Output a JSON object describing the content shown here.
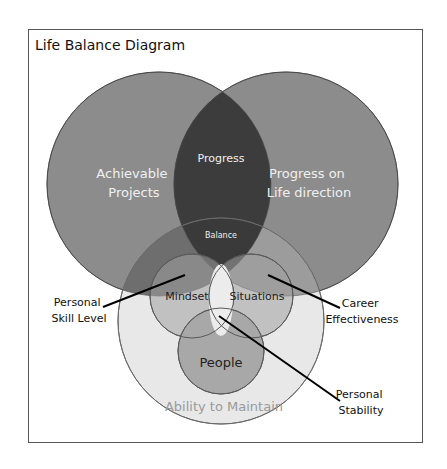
{
  "title": "Life Balance Diagram",
  "colors": {
    "frame_border": "#555555",
    "top_circle": "#8a8a8a",
    "lens": "#3b3b3b",
    "bottom_circle": "#e7e7e7",
    "small_circle": "#a9a9a9",
    "outline": "#5a5a5a",
    "light_text": "#f2f2f2",
    "dark_text": "#222222",
    "maintain_text": "#9a9a9a"
  },
  "circles": {
    "achievable": {
      "label_lines": [
        "Achievable",
        "Projects"
      ]
    },
    "life_direction": {
      "label_lines": [
        "Progress on",
        "Life direction"
      ]
    },
    "progress": {
      "label": "Progress"
    },
    "balance": {
      "label": "Balance"
    },
    "mindset": {
      "label": "Mindset"
    },
    "situations": {
      "label": "Situations"
    },
    "people": {
      "label": "People"
    },
    "ability": {
      "label": "Ability to Maintain"
    }
  },
  "callouts": {
    "skill": {
      "lines": [
        "Personal",
        "Skill Level"
      ]
    },
    "career": {
      "lines": [
        "Career",
        "Effectiveness"
      ]
    },
    "stability": {
      "lines": [
        "Personal",
        "Stability"
      ]
    }
  }
}
